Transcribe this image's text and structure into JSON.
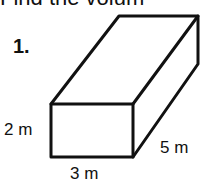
{
  "header": {
    "text": "Find the volum"
  },
  "problem": {
    "number": "1.",
    "shape": "rectangular-prism",
    "dimensions": {
      "height": "2 m",
      "width": "3 m",
      "depth": "5 m"
    }
  }
}
